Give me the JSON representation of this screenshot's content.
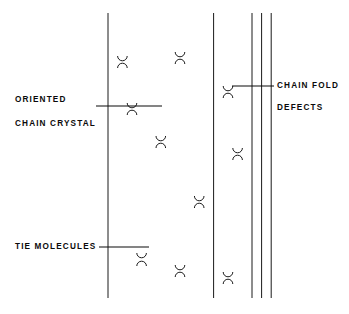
{
  "figure": {
    "background_color": "#ffffff",
    "line_color": "#1a1a1a",
    "label_color": "#0b0b0b",
    "width": 349,
    "height": 314
  },
  "labels": {
    "oriented": "ORIENTED",
    "chain_crystal": "CHAIN CRYSTAL",
    "chain_fold": "CHAIN FOLD",
    "defects": "DEFECTS",
    "tie_molecules": "TIE MOLECULES"
  },
  "annotations": [
    {
      "name": "oriented-chain-crystal",
      "lines": [
        "ORIENTED",
        "CHAIN CRYSTAL"
      ],
      "text_x": 15,
      "text_y": [
        100,
        124
      ],
      "leader": {
        "x1": 96,
        "y1": 106,
        "x2": 162,
        "y2": 106
      }
    },
    {
      "name": "chain-fold-defects",
      "lines": [
        "CHAIN FOLD",
        "DEFECTS"
      ],
      "text_x": 277,
      "text_y": [
        86,
        108
      ],
      "leader": {
        "x1": 232,
        "y1": 86,
        "x2": 274,
        "y2": 86
      }
    },
    {
      "name": "tie-molecules",
      "lines": [
        "TIE MOLECULES"
      ],
      "text_x": 15,
      "text_y": [
        247
      ],
      "leader": {
        "x1": 99,
        "y1": 247,
        "x2": 149,
        "y2": 247
      }
    }
  ],
  "chart_data": {
    "type": "diagram",
    "region": {
      "x_left": 108,
      "x_right": 271,
      "y_top": 13,
      "y_bottom": 298
    },
    "column_pitch": 9.6,
    "column_count": 18,
    "stroke_width": 1.0,
    "elements": [
      {
        "kind": "vertical-chain",
        "x": 108.0,
        "y1": 13,
        "y2": 298
      },
      {
        "kind": "vertical-chain",
        "x": 117.6,
        "y1": 13,
        "y2": 298
      },
      {
        "kind": "vertical-chain",
        "x": 127.2,
        "y1": 13,
        "y2": 298
      },
      {
        "kind": "vertical-chain",
        "x": 136.8,
        "y1": 13,
        "y2": 298
      },
      {
        "kind": "vertical-chain",
        "x": 146.4,
        "y1": 13,
        "y2": 298
      },
      {
        "kind": "vertical-chain",
        "x": 156.0,
        "y1": 13,
        "y2": 298
      },
      {
        "kind": "vertical-chain",
        "x": 165.6,
        "y1": 13,
        "y2": 298
      },
      {
        "kind": "vertical-chain",
        "x": 175.2,
        "y1": 13,
        "y2": 298
      },
      {
        "kind": "vertical-chain",
        "x": 184.8,
        "y1": 13,
        "y2": 298
      },
      {
        "kind": "vertical-chain",
        "x": 194.4,
        "y1": 13,
        "y2": 298
      },
      {
        "kind": "vertical-chain",
        "x": 204.0,
        "y1": 13,
        "y2": 298
      },
      {
        "kind": "vertical-chain",
        "x": 213.6,
        "y1": 13,
        "y2": 298
      },
      {
        "kind": "vertical-chain",
        "x": 223.2,
        "y1": 13,
        "y2": 298
      },
      {
        "kind": "vertical-chain",
        "x": 232.8,
        "y1": 13,
        "y2": 298
      },
      {
        "kind": "vertical-chain",
        "x": 242.4,
        "y1": 13,
        "y2": 298
      },
      {
        "kind": "vertical-chain",
        "x": 252.0,
        "y1": 13,
        "y2": 298
      },
      {
        "kind": "vertical-chain",
        "x": 261.6,
        "y1": 13,
        "y2": 298
      },
      {
        "kind": "vertical-chain",
        "x": 271.2,
        "y1": 13,
        "y2": 298
      }
    ],
    "folds": [
      {
        "name": "fold-a1",
        "x_left": 117.6,
        "x_right": 127.2,
        "y": 56,
        "dir": "down"
      },
      {
        "name": "fold-a2",
        "x_left": 117.6,
        "x_right": 127.2,
        "y": 68,
        "dir": "up"
      },
      {
        "name": "fold-a3",
        "x_left": 127.2,
        "x_right": 136.8,
        "y": 103,
        "dir": "down"
      },
      {
        "name": "fold-a4",
        "x_left": 127.2,
        "x_right": 136.8,
        "y": 115,
        "dir": "up"
      },
      {
        "name": "fold-a5",
        "x_left": 136.8,
        "x_right": 146.4,
        "y": 253,
        "dir": "down"
      },
      {
        "name": "fold-a6",
        "x_left": 136.8,
        "x_right": 146.4,
        "y": 266,
        "dir": "up"
      },
      {
        "name": "fold-b1",
        "x_left": 156.0,
        "x_right": 165.6,
        "y": 136,
        "dir": "down"
      },
      {
        "name": "fold-b2",
        "x_left": 156.0,
        "x_right": 165.6,
        "y": 148,
        "dir": "up"
      },
      {
        "name": "fold-b3",
        "x_left": 175.2,
        "x_right": 184.8,
        "y": 52,
        "dir": "down"
      },
      {
        "name": "fold-b4",
        "x_left": 175.2,
        "x_right": 184.8,
        "y": 64,
        "dir": "up"
      },
      {
        "name": "fold-b5",
        "x_left": 175.2,
        "x_right": 184.8,
        "y": 265,
        "dir": "down"
      },
      {
        "name": "fold-b6",
        "x_left": 175.2,
        "x_right": 184.8,
        "y": 277,
        "dir": "up"
      },
      {
        "name": "fold-c1",
        "x_left": 194.4,
        "x_right": 204.0,
        "y": 196,
        "dir": "down"
      },
      {
        "name": "fold-c2",
        "x_left": 194.4,
        "x_right": 204.0,
        "y": 208,
        "dir": "up"
      },
      {
        "name": "fold-d1",
        "x_left": 223.2,
        "x_right": 232.8,
        "y": 86,
        "dir": "down"
      },
      {
        "name": "fold-d2",
        "x_left": 223.2,
        "x_right": 232.8,
        "y": 98,
        "dir": "up"
      },
      {
        "name": "fold-d3",
        "x_left": 232.8,
        "x_right": 242.4,
        "y": 148,
        "dir": "down"
      },
      {
        "name": "fold-d4",
        "x_left": 232.8,
        "x_right": 242.4,
        "y": 160,
        "dir": "up"
      },
      {
        "name": "fold-d5",
        "x_left": 223.2,
        "x_right": 232.8,
        "y": 272,
        "dir": "down"
      },
      {
        "name": "fold-d6",
        "x_left": 223.2,
        "x_right": 232.8,
        "y": 284,
        "dir": "up"
      }
    ]
  }
}
